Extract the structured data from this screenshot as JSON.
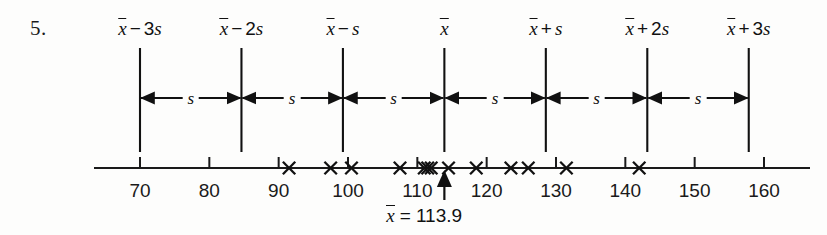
{
  "figure": {
    "item_number": "5.",
    "sd_markers": [
      {
        "label_parts": {
          "mean": "x",
          "op": "−",
          "coef": "3",
          "svar": "s"
        },
        "text": "x̄ − 3s",
        "value": 70.0
      },
      {
        "label_parts": {
          "mean": "x",
          "op": "−",
          "coef": "2",
          "svar": "s"
        },
        "text": "x̄ − 2s",
        "value": 84.633
      },
      {
        "label_parts": {
          "mean": "x",
          "op": "−",
          "coef": "",
          "svar": "s"
        },
        "text": "x̄ − s",
        "value": 99.267
      },
      {
        "label_parts": {
          "mean": "x",
          "op": "",
          "coef": "",
          "svar": ""
        },
        "text": "x̄",
        "value": 113.9
      },
      {
        "label_parts": {
          "mean": "x",
          "op": "+",
          "coef": "",
          "svar": "s"
        },
        "text": "x̄ + s",
        "value": 128.533
      },
      {
        "label_parts": {
          "mean": "x",
          "op": "+",
          "coef": "2",
          "svar": "s"
        },
        "text": "x̄ + 2s",
        "value": 143.167
      },
      {
        "label_parts": {
          "mean": "x",
          "op": "+",
          "coef": "3",
          "svar": "s"
        },
        "text": "x̄ + 3s",
        "value": 157.8
      }
    ],
    "gap_label": "s",
    "gap_count": 6,
    "mean_readout": {
      "symbol": "x",
      "equals": "=",
      "value": "113.9",
      "text": "x̄ = 113.9"
    },
    "colors": {
      "ink": "#111111",
      "paper": "#fdfdfc",
      "axis": "#1a1a1a"
    }
  },
  "chart_data": {
    "type": "scatter",
    "title": "",
    "subtitle": "",
    "xlabel": "",
    "ylabel": "",
    "xlim": [
      65,
      165
    ],
    "grid": false,
    "legend": null,
    "tick_values": [
      70,
      80,
      90,
      100,
      110,
      120,
      130,
      140,
      150,
      160
    ],
    "tick_labels": [
      "70",
      "80",
      "90",
      "100",
      "110",
      "120",
      "130",
      "140",
      "150",
      "160"
    ],
    "data_points": [
      91.5,
      97.5,
      100.5,
      107.5,
      111.0,
      111.5,
      112.0,
      114.5,
      118.5,
      123.5,
      126.0,
      131.5,
      142.0
    ],
    "mean": 113.9,
    "mean_label": "x̄ = 113.9",
    "std_dev": 14.633,
    "sd_line_values": [
      70.0,
      84.633,
      99.267,
      113.9,
      128.533,
      143.167,
      157.8
    ],
    "sd_line_labels": [
      "x̄ − 3s",
      "x̄ − 2s",
      "x̄ − s",
      "x̄",
      "x̄ + s",
      "x̄ + 2s",
      "x̄ + 3s"
    ],
    "interval_label": "s",
    "marker": "x"
  }
}
